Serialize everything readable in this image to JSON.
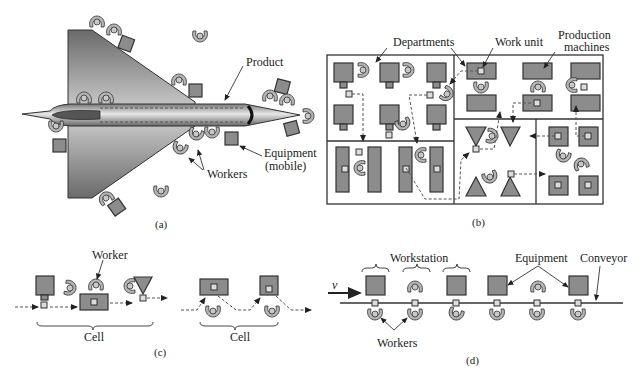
{
  "figure": {
    "panels": {
      "a": {
        "caption": "(a)",
        "labels": {
          "product": "Product",
          "equipment_line1": "Equipment",
          "equipment_line2": "(mobile)",
          "workers": "Workers"
        }
      },
      "b": {
        "caption": "(b)",
        "labels": {
          "departments": "Departments",
          "work_unit": "Work unit",
          "machines_line1": "Production",
          "machines_line2": "machines"
        }
      },
      "c": {
        "caption": "(c)",
        "labels": {
          "worker": "Worker",
          "cell_left": "Cell",
          "cell_right": "Cell"
        }
      },
      "d": {
        "caption": "(d)",
        "labels": {
          "velocity": "v",
          "workstation": "Workstation",
          "equipment": "Equipment",
          "conveyor": "Conveyor",
          "workers": "Workers"
        }
      }
    },
    "colors": {
      "equipment_fill": "#8c8c8c",
      "worker_fill": "#b4b4b4",
      "outline": "#333333",
      "work_unit_fill": "#dcdcdc"
    }
  }
}
